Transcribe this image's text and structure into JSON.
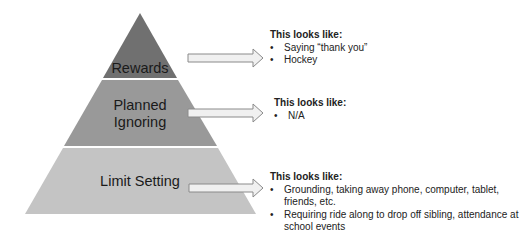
{
  "pyramid": {
    "levels": [
      {
        "label": "Rewards",
        "color": "#707070"
      },
      {
        "label_line1": "Planned",
        "label_line2": "Ignoring",
        "color": "#999999"
      },
      {
        "label": "Limit Setting",
        "color": "#c4c4c4"
      }
    ]
  },
  "callouts": [
    {
      "heading": "This looks like:",
      "items": [
        "Saying “thank you”",
        "Hockey"
      ]
    },
    {
      "heading": "This looks like:",
      "items": [
        "N/A"
      ]
    },
    {
      "heading": "This looks like:",
      "items": [
        "Grounding, taking away phone, computer, tablet, friends, etc.",
        "Requiring ride along to drop off sibling, attendance at school events"
      ]
    }
  ]
}
